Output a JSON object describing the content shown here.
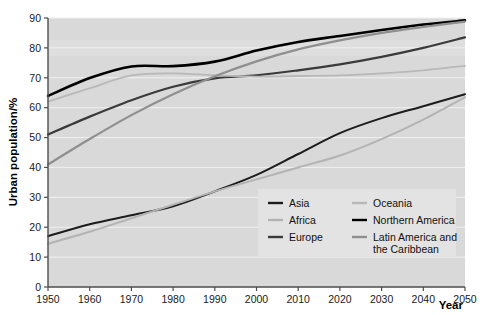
{
  "chart_data": {
    "type": "line",
    "title": "",
    "xlabel": "Year",
    "ylabel": "Urban population/%",
    "xlim": [
      1950,
      2050
    ],
    "ylim": [
      0,
      90
    ],
    "grid": true,
    "legend_position": "bottom-right",
    "x": [
      1950,
      1960,
      1970,
      1980,
      1990,
      2000,
      2010,
      2020,
      2030,
      2040,
      2050
    ],
    "xticks": [
      "1950",
      "1960",
      "1970",
      "1980",
      "1990",
      "2000",
      "2010",
      "2020",
      "2030",
      "2040",
      "2050"
    ],
    "yticks": [
      "0",
      "10",
      "20",
      "30",
      "40",
      "50",
      "60",
      "70",
      "80",
      "90"
    ],
    "series": [
      {
        "name": "Asia",
        "color": "#1c1c1c",
        "width": 2.0,
        "values": [
          17.0,
          21.0,
          24.0,
          27.0,
          32.0,
          37.5,
          44.5,
          51.5,
          56.5,
          60.5,
          64.5
        ]
      },
      {
        "name": "Africa",
        "color": "#b3b3b3",
        "width": 2.0,
        "values": [
          14.5,
          18.5,
          23.0,
          27.5,
          32.0,
          36.0,
          40.0,
          44.0,
          49.5,
          56.0,
          63.5
        ]
      },
      {
        "name": "Europe",
        "color": "#3a3a3a",
        "width": 2.2,
        "values": [
          51.0,
          57.0,
          62.5,
          67.0,
          69.8,
          70.8,
          72.5,
          74.5,
          77.0,
          80.0,
          83.5
        ]
      },
      {
        "name": "Oceania",
        "color": "#b8b8b8",
        "width": 1.8,
        "values": [
          62.0,
          66.5,
          70.8,
          71.5,
          70.8,
          70.4,
          70.6,
          70.8,
          71.5,
          72.5,
          74.0
        ]
      },
      {
        "name": "Northern America",
        "color": "#000000",
        "width": 2.6,
        "values": [
          63.9,
          69.9,
          73.8,
          73.9,
          75.4,
          79.1,
          82.0,
          84.0,
          86.0,
          87.8,
          89.2
        ]
      },
      {
        "name": "Latin America and the Caribbean",
        "color": "#8f8f8f",
        "width": 2.2,
        "values": [
          41.0,
          49.5,
          57.5,
          64.5,
          70.5,
          75.5,
          79.5,
          82.5,
          85.0,
          87.0,
          88.8
        ]
      }
    ],
    "legend_entries": [
      {
        "label": "Asia",
        "color": "#1c1c1c",
        "column": 0,
        "row": 0
      },
      {
        "label": "Africa",
        "color": "#b3b3b3",
        "column": 0,
        "row": 1
      },
      {
        "label": "Europe",
        "color": "#3a3a3a",
        "column": 0,
        "row": 2
      },
      {
        "label": "Oceania",
        "color": "#b8b8b8",
        "column": 1,
        "row": 0
      },
      {
        "label": "Northern America",
        "color": "#000000",
        "column": 1,
        "row": 1
      },
      {
        "label": "Latin America and",
        "label2": "the Caribbean",
        "color": "#8f8f8f",
        "column": 1,
        "row": 2
      }
    ],
    "colors": {
      "plot_background": "#d9d9d9",
      "grid": "#f0f0f0",
      "axis": "#4d4d4d",
      "legend_background": "#e3e3e3",
      "page_background": "#ffffff"
    }
  }
}
